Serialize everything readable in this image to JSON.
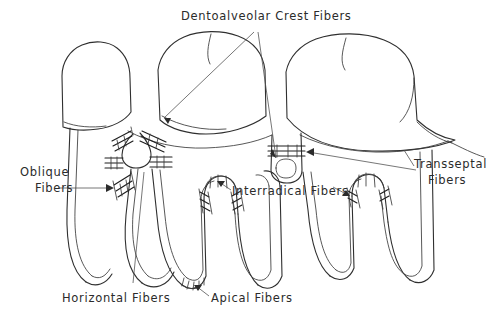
{
  "figure": {
    "background_color": "#ffffff",
    "ink_color": "#2f2f2f",
    "text_color": "#2b2b2b",
    "style": "pen-and-ink line drawing"
  },
  "labels": {
    "dentoalveolar_crest": "Dentoalveolar  Crest  Fibers",
    "oblique_line1": "Oblique",
    "oblique_line2": "Fibers",
    "transseptal_line1": "Transseptal",
    "transseptal_line2": "Fibers",
    "interradical": "Interradical  Fibers",
    "horizontal": "Horizontal  Fibers",
    "apical": "Apical Fibers"
  },
  "anatomy": {
    "teeth_count": 3,
    "structures": [
      "tooth-crown-left",
      "tooth-crown-middle",
      "tooth-crown-right",
      "root-left",
      "root-middle-mesial",
      "root-middle-distal",
      "root-right-mesial",
      "root-right-distal",
      "alveolar-crest-line",
      "interdental-septum-left",
      "interdental-septum-right"
    ],
    "fiber_groups": [
      "dentoalveolar-crest-fibers",
      "horizontal-fibers",
      "oblique-fibers",
      "apical-fibers",
      "interradical-fibers",
      "transseptal-fibers"
    ]
  }
}
